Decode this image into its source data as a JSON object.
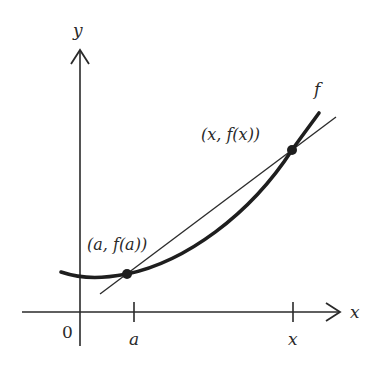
{
  "figure": {
    "type": "secant line diagram",
    "labels": {
      "y_axis": "y",
      "x_axis": "x",
      "origin": "0",
      "tick_a": "a",
      "tick_x": "x",
      "function": "f",
      "point_a": "(a, f(a))",
      "point_x": "(x, f(x))"
    },
    "colors": {
      "ink": "#2a2a2a",
      "background": "#ffffff"
    }
  }
}
